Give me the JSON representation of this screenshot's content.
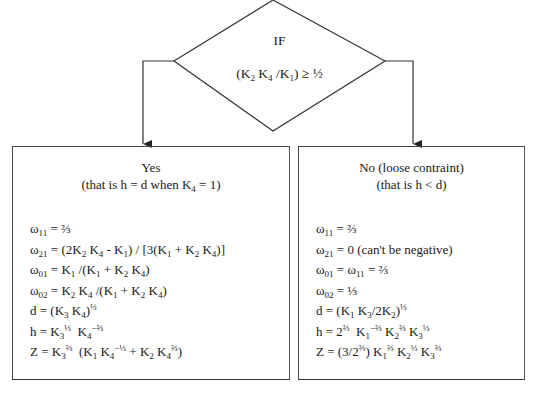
{
  "decision": {
    "label": "IF",
    "condition": "(K₂ K₄ /K₁) ≥ ½"
  },
  "branches": [
    {
      "id": "yes",
      "title": "Yes",
      "subtitle": "(that is h = d when K₄ = 1)",
      "equations": [
        "ω₁₁ = ⅔",
        "ω₂₁ = (2K₂ K₄ - K₁) / [3(K₁ + K₂ K₄)]",
        "ω₀₁ = K₁ /(K₁ + K₂ K₄)",
        "ω₀₂ = K₂ K₄ /(K₁ + K₂ K₄)",
        "d = (K₃ K₄)^⅓",
        "h = K₃^⅓  K₄^−⅔",
        "Z = K₃^⅔  (K₁ K₄^−⅓ + K₂ K₄^⅔)"
      ]
    },
    {
      "id": "no",
      "title": "No (loose contraint)",
      "subtitle": "(that is h < d)",
      "equations": [
        "ω₁₁ = ⅔",
        "ω₂₁ = 0 (can't be negative)",
        "ω₀₁ = ω₁₁ = ⅔",
        "ω₀₂ = ⅓",
        "d = (K₁ K₃/2K₂)^⅓",
        "h = 2^⅔  K₁^−⅔ K₂^⅔ K₃^⅓",
        "Z = (3/2^⅔) K₁^⅔ K₂^⅓ K₃^⅔"
      ]
    }
  ],
  "colors": {
    "stroke": "#333333",
    "text": "#1a1a1a",
    "background": "#ffffff"
  }
}
